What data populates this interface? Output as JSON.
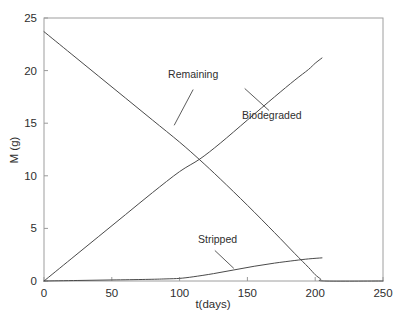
{
  "chart_data": {
    "type": "line",
    "title": "",
    "xlabel": "t(days)",
    "ylabel": "M (g)",
    "xlim": [
      0,
      250
    ],
    "ylim": [
      0,
      25
    ],
    "xticks": [
      0,
      50,
      100,
      150,
      200,
      250
    ],
    "yticks": [
      0,
      5,
      10,
      15,
      20,
      25
    ],
    "xtick_labels": [
      "0",
      "50",
      "100",
      "150",
      "200",
      "250"
    ],
    "ytick_labels": [
      "0",
      "5",
      "10",
      "15",
      "20",
      "25"
    ],
    "grid": false,
    "legend_position": "inline-annotations",
    "line_color": "#4a4a4a",
    "frame_color": "#9a9a9a",
    "series": [
      {
        "name": "Remaining",
        "label": "Remaining",
        "x": [
          0,
          20,
          40,
          60,
          80,
          100,
          115,
          130,
          150,
          170,
          185,
          195,
          200,
          204,
          207,
          250
        ],
        "values": [
          23.7,
          21.6,
          19.5,
          17.4,
          15.3,
          13.2,
          11.5,
          9.7,
          7.2,
          4.6,
          2.6,
          1.3,
          0.6,
          0.2,
          0.0,
          0.0
        ]
      },
      {
        "name": "Biodegraded",
        "label": "Biodegraded",
        "x": [
          0,
          20,
          40,
          60,
          80,
          100,
          115,
          130,
          150,
          170,
          185,
          195,
          200,
          205
        ],
        "values": [
          0.0,
          2.1,
          4.2,
          6.3,
          8.4,
          10.4,
          11.6,
          13.1,
          15.3,
          17.5,
          19.1,
          20.1,
          20.7,
          21.2
        ]
      },
      {
        "name": "Stripped",
        "label": "Stripped",
        "x": [
          0,
          25,
          50,
          75,
          90,
          100,
          110,
          125,
          140,
          155,
          170,
          185,
          195,
          205
        ],
        "values": [
          0.0,
          0.05,
          0.1,
          0.15,
          0.2,
          0.25,
          0.4,
          0.7,
          1.05,
          1.4,
          1.7,
          1.95,
          2.1,
          2.2
        ]
      }
    ],
    "annotations": [
      {
        "text": "Remaining",
        "label_x": 110,
        "label_y": 19.3,
        "leader_from": [
          110,
          18.2
        ],
        "leader_to": [
          96,
          14.8
        ]
      },
      {
        "text": "Biodegraded",
        "label_x": 168,
        "label_y": 15.4,
        "leader_from": [
          166,
          16.2
        ],
        "leader_to": [
          148,
          18.3
        ]
      },
      {
        "text": "Stripped",
        "label_x": 128,
        "label_y": 3.6,
        "leader_from": [
          126,
          2.9
        ],
        "leader_to": [
          140,
          1.2
        ]
      }
    ]
  }
}
